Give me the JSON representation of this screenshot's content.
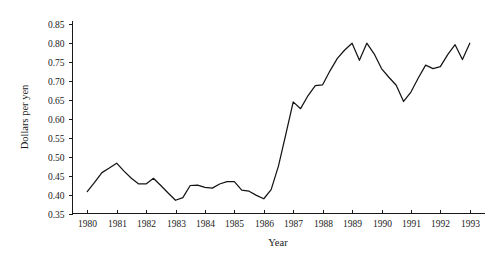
{
  "chart_data": {
    "type": "line",
    "title": "",
    "xlabel": "Year",
    "ylabel": "Dollars per yen",
    "xlim": [
      1979.5,
      1993.5
    ],
    "ylim": [
      0.35,
      0.86
    ],
    "grid": false,
    "legend": false,
    "y_ticks": [
      "0.35",
      "0.40",
      "0.45",
      "0.50",
      "0.55",
      "0.60",
      "0.65",
      "0.70",
      "0.75",
      "0.80",
      "0.85"
    ],
    "y_tick_values": [
      0.35,
      0.4,
      0.45,
      0.5,
      0.55,
      0.6,
      0.65,
      0.7,
      0.75,
      0.8,
      0.85
    ],
    "x_ticks": [
      "1980",
      "1981",
      "1982",
      "1983",
      "1984",
      "1985",
      "1986",
      "1987",
      "1988",
      "1989",
      "1990",
      "1991",
      "1992",
      "1993"
    ],
    "x_tick_values": [
      1980,
      1981,
      1982,
      1983,
      1984,
      1985,
      1986,
      1987,
      1988,
      1989,
      1990,
      1991,
      1992,
      1993
    ],
    "series": [
      {
        "name": "Dollars per yen",
        "color": "#141414",
        "x": [
          1980.0,
          1980.25,
          1980.5,
          1980.75,
          1981.0,
          1981.25,
          1981.5,
          1981.75,
          1982.0,
          1982.25,
          1982.5,
          1982.75,
          1983.0,
          1983.25,
          1983.5,
          1983.75,
          1984.0,
          1984.25,
          1984.5,
          1984.75,
          1985.0,
          1985.25,
          1985.5,
          1985.75,
          1986.0,
          1986.25,
          1986.5,
          1986.75,
          1987.0,
          1987.25,
          1987.5,
          1987.75,
          1988.0,
          1988.25,
          1988.5,
          1988.75,
          1989.0,
          1989.25,
          1989.5,
          1989.75,
          1990.0,
          1990.25,
          1990.5,
          1990.75,
          1991.0,
          1991.25,
          1991.5,
          1991.75,
          1992.0,
          1992.25,
          1992.5,
          1992.75,
          1993.0
        ],
        "values": [
          0.408,
          0.432,
          0.458,
          0.47,
          0.483,
          0.462,
          0.443,
          0.428,
          0.428,
          0.443,
          0.424,
          0.404,
          0.385,
          0.392,
          0.424,
          0.425,
          0.419,
          0.417,
          0.428,
          0.434,
          0.434,
          0.412,
          0.409,
          0.398,
          0.389,
          0.413,
          0.476,
          0.56,
          0.645,
          0.627,
          0.661,
          0.688,
          0.69,
          0.727,
          0.76,
          0.782,
          0.8,
          0.755,
          0.8,
          0.772,
          0.733,
          0.71,
          0.689,
          0.646,
          0.671,
          0.708,
          0.742,
          0.733,
          0.738,
          0.77,
          0.796,
          0.757,
          0.8
        ]
      }
    ],
    "annotations": []
  }
}
